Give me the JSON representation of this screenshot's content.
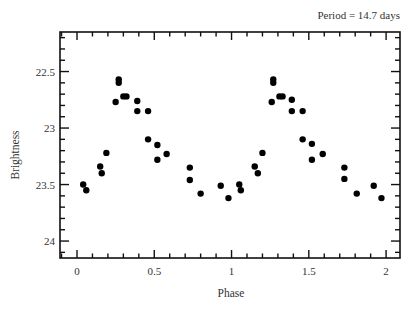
{
  "chart_data": {
    "type": "scatter",
    "title": "",
    "subtitle": "Period = 14.7 days",
    "xlabel": "Phase",
    "ylabel": "Brightness",
    "xlim": [
      -0.11,
      2.09
    ],
    "ylim": [
      22.15,
      24.15
    ],
    "y_inverted": true,
    "grid": false,
    "legend": null,
    "x_ticks": [
      0,
      0.5,
      1,
      1.5,
      2
    ],
    "x_tick_labels": [
      "0",
      "0.5",
      "1",
      "1.5",
      "2"
    ],
    "x_minor_step": 0.1,
    "y_ticks": [
      22.5,
      23,
      23.5,
      24
    ],
    "y_tick_labels": [
      "22.5",
      "23",
      "23.5",
      "24"
    ],
    "y_minor_step": 0.1,
    "marker": {
      "shape": "circle",
      "color": "#000000",
      "radius": 3.2
    },
    "series": [
      {
        "name": "Brightness vs Phase",
        "points": [
          [
            0.04,
            23.5
          ],
          [
            0.06,
            23.55
          ],
          [
            0.15,
            23.34
          ],
          [
            0.16,
            23.4
          ],
          [
            0.19,
            23.22
          ],
          [
            0.25,
            22.77
          ],
          [
            0.27,
            22.57
          ],
          [
            0.27,
            22.6
          ],
          [
            0.3,
            22.72
          ],
          [
            0.32,
            22.72
          ],
          [
            0.39,
            22.76
          ],
          [
            0.39,
            22.85
          ],
          [
            0.46,
            22.85
          ],
          [
            0.46,
            23.1
          ],
          [
            0.52,
            23.15
          ],
          [
            0.52,
            23.28
          ],
          [
            0.58,
            23.23
          ],
          [
            0.73,
            23.35
          ],
          [
            0.73,
            23.46
          ],
          [
            0.8,
            23.58
          ],
          [
            0.93,
            23.51
          ],
          [
            0.98,
            23.62
          ],
          [
            1.05,
            23.5
          ],
          [
            1.06,
            23.55
          ],
          [
            1.15,
            23.34
          ],
          [
            1.17,
            23.4
          ],
          [
            1.2,
            23.22
          ],
          [
            1.26,
            22.77
          ],
          [
            1.27,
            22.57
          ],
          [
            1.27,
            22.6
          ],
          [
            1.31,
            22.72
          ],
          [
            1.33,
            22.72
          ],
          [
            1.39,
            22.75
          ],
          [
            1.39,
            22.85
          ],
          [
            1.46,
            22.85
          ],
          [
            1.46,
            23.1
          ],
          [
            1.52,
            23.14
          ],
          [
            1.52,
            23.28
          ],
          [
            1.59,
            23.23
          ],
          [
            1.73,
            23.35
          ],
          [
            1.73,
            23.45
          ],
          [
            1.81,
            23.58
          ],
          [
            1.92,
            23.51
          ],
          [
            1.97,
            23.62
          ]
        ]
      }
    ]
  },
  "plot_area": {
    "left": 60,
    "top": 32,
    "right": 400,
    "bottom": 258
  }
}
